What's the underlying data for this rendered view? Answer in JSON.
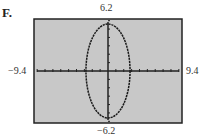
{
  "panel": {
    "label": "F."
  },
  "chart_data": {
    "type": "line",
    "title": "",
    "window": {
      "xmin": -9.4,
      "xmax": 9.4,
      "ymin": -6.2,
      "ymax": 6.2
    },
    "labels": {
      "xmin": "−9.4",
      "xmax": "9.4",
      "ymin": "−6.2",
      "ymax": "6.2"
    },
    "curve": {
      "kind": "ellipse",
      "center": [
        0,
        0
      ],
      "semi_x": 2.8,
      "semi_y": 5.6
    },
    "ticks": {
      "x_step": 1,
      "y_step": 1
    },
    "grid": false,
    "colors": {
      "background": "#c8c8c8",
      "frame": "#222222",
      "curve": "#1a1a1a"
    }
  }
}
